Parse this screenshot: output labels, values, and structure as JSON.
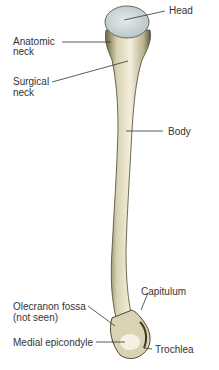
{
  "diagram": {
    "colors": {
      "bone": "#e8e3c8",
      "bone_shadow": "#6b6244",
      "head_cartilage": "#cfd8dc",
      "leader_line": "#333333",
      "label_text": "#333333",
      "background": "#ffffff"
    },
    "labels": {
      "head": "Head",
      "anatomic_neck_1": "Anatomic",
      "anatomic_neck_2": "neck",
      "surgical_neck_1": "Surgical",
      "surgical_neck_2": "neck",
      "body": "Body",
      "capitulum": "Capitulum",
      "olecranon_fossa_1": "Olecranon fossa",
      "olecranon_fossa_2": "(not seen)",
      "medial_epicondyle": "Medial epicondyle",
      "trochlea": "Trochlea"
    }
  }
}
